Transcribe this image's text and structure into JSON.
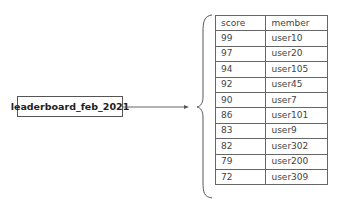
{
  "key": {
    "label": "leaderboard_feb_2021"
  },
  "table": {
    "headers": [
      "score",
      "member"
    ],
    "rows": [
      [
        "99",
        "user10"
      ],
      [
        "97",
        "user20"
      ],
      [
        "94",
        "user105"
      ],
      [
        "92",
        "user45"
      ],
      [
        "90",
        "user7"
      ],
      [
        "86",
        "user101"
      ],
      [
        "83",
        "user9"
      ],
      [
        "82",
        "user302"
      ],
      [
        "79",
        "user200"
      ],
      [
        "72",
        "user309"
      ]
    ]
  },
  "colors": {
    "stroke": "#555555",
    "text": "#444444",
    "background": "#ffffff"
  }
}
